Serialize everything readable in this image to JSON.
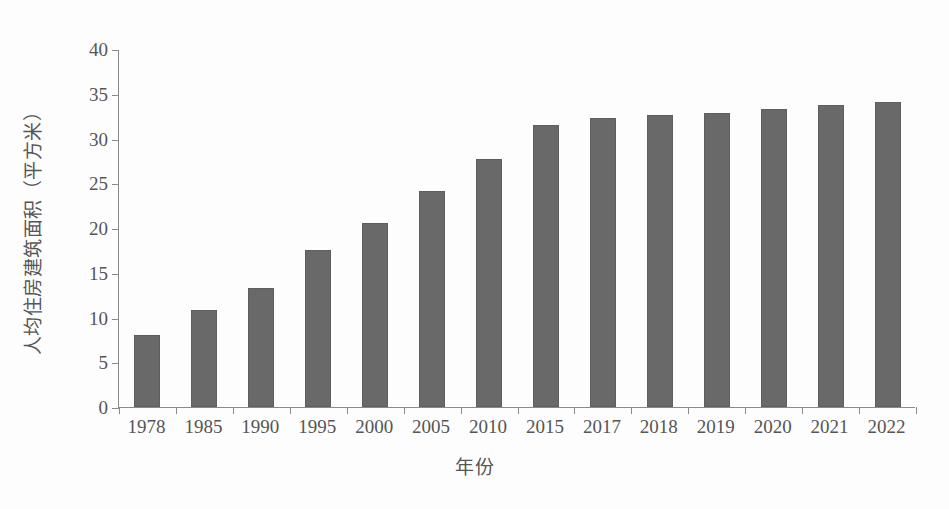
{
  "chart_data": {
    "type": "bar",
    "title": "",
    "xlabel": "年份",
    "ylabel": "人均住房建筑面积（平方米）",
    "categories": [
      "1978",
      "1985",
      "1990",
      "1995",
      "2000",
      "2005",
      "2010",
      "2015",
      "2017",
      "2018",
      "2019",
      "2020",
      "2021",
      "2022"
    ],
    "values": [
      8.1,
      10.8,
      13.3,
      17.5,
      20.6,
      24.1,
      27.7,
      31.5,
      32.3,
      32.6,
      32.9,
      33.3,
      33.7,
      34.1
    ],
    "series": [
      {
        "name": "人均住房建筑面积",
        "values": [
          8.1,
          10.8,
          13.3,
          17.5,
          20.6,
          24.1,
          27.7,
          31.5,
          32.3,
          32.6,
          32.9,
          33.3,
          33.7,
          34.1
        ]
      }
    ],
    "ylim": [
      0,
      40
    ],
    "y_ticks": [
      0,
      5,
      10,
      15,
      20,
      25,
      30,
      35,
      40
    ],
    "y_tick_labels": [
      "0",
      "5",
      "10",
      "15",
      "20",
      "25",
      "30",
      "35",
      "40"
    ],
    "grid": false,
    "legend": false,
    "legend_position": "none",
    "bar_color": "#696969",
    "axis_color": "#8a8a8a",
    "background_color": "#fdfdfd",
    "text_color": "#555555"
  }
}
